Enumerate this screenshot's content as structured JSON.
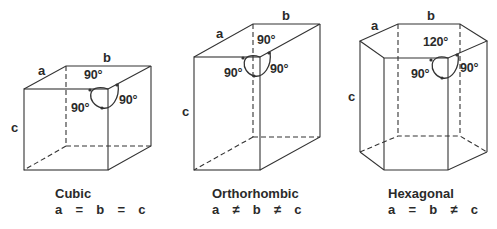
{
  "diagram": {
    "line_color": "#333333",
    "background": "#ffffff",
    "systems": [
      {
        "name": "Cubic",
        "relation": "a  =  b  =  c",
        "axes": {
          "a": "a",
          "b": "b",
          "c": "c"
        },
        "angles": [
          "90°",
          "90°",
          "90°"
        ]
      },
      {
        "name": "Orthorhombic",
        "relation": "a  ≠  b  ≠  c",
        "axes": {
          "a": "a",
          "b": "b",
          "c": "c"
        },
        "angles": [
          "90°",
          "90°",
          "90°"
        ]
      },
      {
        "name": "Hexagonal",
        "relation": "a  =  b  ≠  c",
        "axes": {
          "a": "a",
          "b": "b",
          "c": "c"
        },
        "angles": [
          "120°",
          "90°",
          "90°"
        ]
      }
    ]
  }
}
